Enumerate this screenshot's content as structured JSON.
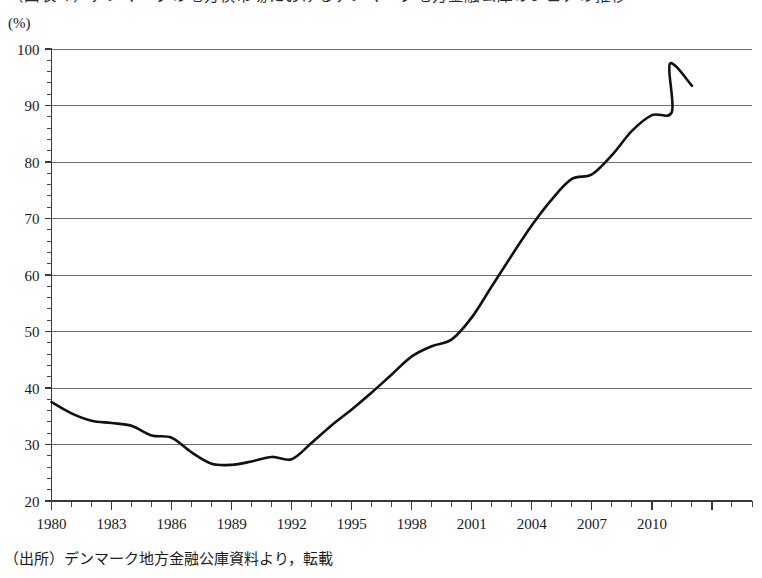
{
  "title": "（図表４）デンマークの地方債市場におけるデンマーク地方金融公庫のシェアの推移",
  "unit_label": "(%)",
  "source_note": "（出所）デンマーク地方金融公庫資料より，転載",
  "chart_data": {
    "type": "line",
    "title": "（図表４）デンマークの地方債市場におけるデンマーク地方金融公庫のシェアの推移",
    "xlabel": "",
    "ylabel": "(%)",
    "xlim": [
      1980,
      2015
    ],
    "ylim": [
      20,
      100
    ],
    "ytick_step": 10,
    "yticks": [
      20,
      30,
      40,
      50,
      60,
      70,
      80,
      90,
      100
    ],
    "ytick_labels": [
      "20",
      "30",
      "40",
      "50",
      "60",
      "70",
      "80",
      "90",
      "100"
    ],
    "y_minor_step": 2,
    "xticks": [
      1980,
      1981,
      1982,
      1983,
      1984,
      1985,
      1986,
      1987,
      1988,
      1989,
      1990,
      1991,
      1992,
      1993,
      1994,
      1995,
      1996,
      1997,
      1998,
      1999,
      2000,
      2001,
      2002,
      2003,
      2004,
      2005,
      2006,
      2007,
      2008,
      2009,
      2010,
      2011,
      2012,
      2013,
      2014,
      2015
    ],
    "xtick_labels_shown": [
      "1980",
      "1983",
      "1986",
      "1989",
      "1992",
      "1995",
      "1998",
      "2001",
      "2004",
      "2007",
      "2010"
    ],
    "xtick_label_step": 3,
    "grid": "horizontal",
    "legend": "none",
    "line_color": "#111111",
    "grid_color": "#6e6e6e",
    "series": [
      {
        "name": "デンマーク地方金融公庫のシェア",
        "x": [
          1980,
          1981,
          1982,
          1983,
          1984,
          1985,
          1986,
          1987,
          1988,
          1989,
          1990,
          1991,
          1992,
          1993,
          1994,
          1995,
          1996,
          1997,
          1998,
          1999,
          2000,
          2001,
          2002,
          2003,
          2004,
          2005,
          2006,
          2007,
          2008,
          2009,
          2010,
          2011,
          2012
        ],
        "values": [
          37.5,
          35.5,
          34.2,
          33.8,
          33.3,
          31.6,
          31.2,
          28.6,
          26.6,
          26.4,
          27.0,
          27.8,
          27.4,
          30.3,
          33.4,
          36.2,
          39.2,
          42.4,
          45.6,
          47.4,
          48.6,
          52.5,
          58.0,
          63.5,
          68.8,
          73.4,
          77.0,
          77.8,
          81.2,
          85.5,
          88.3,
          88.9,
          93.5
        ],
        "peak": {
          "x": 2010.9,
          "y": 97.4
        },
        "end_value": 93.5
      }
    ]
  }
}
